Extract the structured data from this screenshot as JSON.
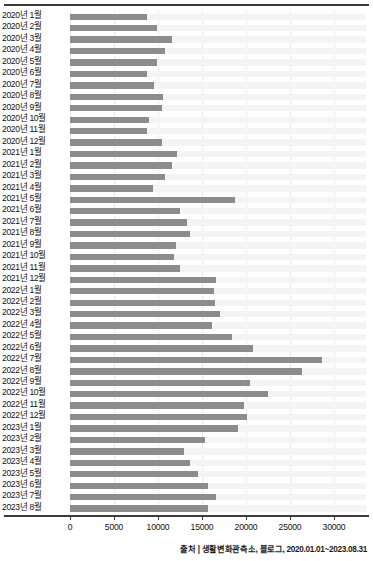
{
  "chart_data": {
    "type": "bar",
    "orientation": "horizontal",
    "title": "",
    "xlabel": "",
    "ylabel": "",
    "xlim": [
      0,
      33000
    ],
    "grid": true,
    "legend": false,
    "xticks": [
      0,
      5000,
      10000,
      15000,
      20000,
      25000,
      30000
    ],
    "xtick_labels": [
      "0",
      "5000",
      "10000",
      "15000",
      "20000",
      "25000",
      "30000"
    ],
    "bar_color": "#8c8c8c",
    "categories": [
      "2020년 1월",
      "2020년 2월",
      "2020년 3월",
      "2020년 4월",
      "2020년 5월",
      "2020년 6월",
      "2020년 7월",
      "2020년 8월",
      "2020년 9월",
      "2020년 10월",
      "2020년 11월",
      "2020년 12월",
      "2021년 1월",
      "2021년 2월",
      "2021년 3월",
      "2021년 4월",
      "2021년 5월",
      "2021년 6월",
      "2021년 7월",
      "2021년 8월",
      "2021년 9월",
      "2021년 10월",
      "2021년 11월",
      "2021년 12월",
      "2022년 1월",
      "2022년 2월",
      "2022년 3월",
      "2022년 4월",
      "2022년 5월",
      "2022년 6월",
      "2022년 7월",
      "2022년 8월",
      "2022년 9월",
      "2022년 10월",
      "2022년 11월",
      "2022년 12월",
      "2023년 1월",
      "2023년 2월",
      "2023년 3월",
      "2023년 4월",
      "2023년 5월",
      "2023년 6월",
      "2023년 7월",
      "2023년 8월"
    ],
    "values": [
      8700,
      9900,
      11600,
      10800,
      9900,
      8700,
      9600,
      10600,
      10400,
      9000,
      8800,
      10400,
      12200,
      11600,
      10800,
      9400,
      18700,
      12500,
      13300,
      13600,
      12000,
      11800,
      12500,
      16600,
      16400,
      16500,
      17000,
      16100,
      18400,
      20800,
      28600,
      26400,
      20400,
      22500,
      19800,
      20100,
      19100,
      15300,
      12900,
      13600,
      14500,
      15700,
      16600,
      15700
    ]
  },
  "footer": {
    "source_text": "출처 | 생활변화관측소, 블로그, 2020.01.01~2023.08.31"
  }
}
